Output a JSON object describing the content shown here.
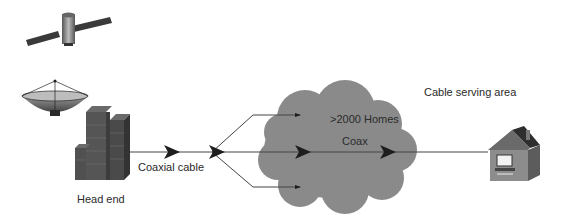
{
  "diagram": {
    "colors": {
      "background": "#ffffff",
      "cloud": "#8a8a8a",
      "line": "#444444",
      "arrow": "#1e1e1e",
      "building": "#4d4d4d",
      "house_wall": "#8c8c8c",
      "house_roof": "#5a5a5a"
    },
    "nodes": [
      {
        "id": "satellite",
        "icon": "satellite-icon"
      },
      {
        "id": "dish",
        "icon": "satellite-dish-icon"
      },
      {
        "id": "head-end",
        "icon": "building-icon",
        "label": "Head end"
      },
      {
        "id": "splitter",
        "icon": "arrowhead-icon"
      },
      {
        "id": "cloud",
        "icon": "cloud-icon",
        "label": ">2000 Homes",
        "sublabel": "Coax"
      },
      {
        "id": "home",
        "icon": "house-icon"
      }
    ],
    "labels": {
      "head_end": "Head end",
      "coaxial_cable": "Coaxial cable",
      "homes": ">2000 Homes",
      "coax": "Coax",
      "cable_serving_area": "Cable serving area"
    }
  }
}
